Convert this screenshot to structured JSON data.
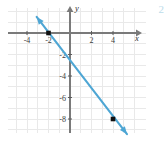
{
  "figure": {
    "corner_number": "2",
    "colors": {
      "line": "#4ea6d4",
      "grid": "#e9e9e9",
      "axis": "#7a7a7a",
      "point": "#111111",
      "tick_text": "#3b3b3b",
      "corner_number": "#bcdcea",
      "background": "#ffffff"
    }
  },
  "chart_data": {
    "type": "line",
    "title": "",
    "xlabel": "x",
    "ylabel": "y",
    "xlim": [
      -5.6,
      6.2
    ],
    "ylim": [
      -9.6,
      2.2
    ],
    "grid": true,
    "legend": null,
    "x_ticks": [
      -4,
      -2,
      2,
      4
    ],
    "x_tick_labels": [
      "-4",
      "-2",
      "2",
      "4"
    ],
    "y_ticks": [
      -2,
      -4,
      -6,
      -8
    ],
    "y_tick_labels": [
      "-2",
      "-4",
      "-6",
      "-8"
    ],
    "x_gridlines": [
      -5,
      -4,
      -3,
      -2,
      -1,
      0,
      1,
      2,
      3,
      4,
      5,
      6
    ],
    "y_gridlines": [
      2,
      1,
      0,
      -1,
      -2,
      -3,
      -4,
      -5,
      -6,
      -7,
      -8,
      -9
    ],
    "series": [
      {
        "name": "line",
        "type": "line",
        "color": "#4ea6d4",
        "slope": -1.3333,
        "intercept": -2.6667,
        "equation": "y = -4/3 x - 8/3",
        "arrow_start": true,
        "arrow_end": true,
        "draw_from": [
          -3.1,
          1.5
        ],
        "draw_to": [
          5.3,
          -9.4
        ],
        "points": [
          {
            "x": -2,
            "y": 0,
            "marker": "square",
            "color": "#111111"
          },
          {
            "x": 4,
            "y": -8,
            "marker": "square",
            "color": "#111111"
          }
        ]
      }
    ]
  }
}
